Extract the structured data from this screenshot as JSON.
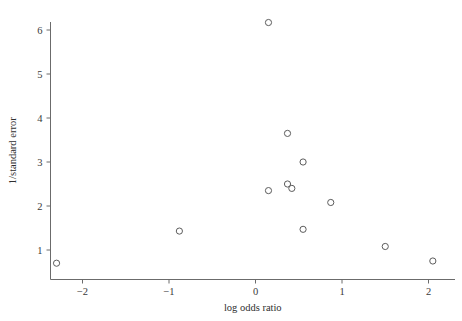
{
  "chart_data": {
    "type": "scatter",
    "title": "",
    "xlabel": "log odds ratio",
    "ylabel": "1/standard error",
    "xlim": [
      -2.55,
      2.3
    ],
    "ylim": [
      0.45,
      6.45
    ],
    "xticks": [
      "−2",
      "−1",
      "0",
      "1",
      "2"
    ],
    "xtick_values": [
      -2,
      -1,
      0,
      1,
      2
    ],
    "yticks": [
      "1",
      "2",
      "3",
      "4",
      "5",
      "6"
    ],
    "ytick_values": [
      1,
      2,
      3,
      4,
      5,
      6
    ],
    "grid": false,
    "legend": "none",
    "marker": "open-circle",
    "marker_color": "#5c5c5c",
    "n_points": 12,
    "points": [
      {
        "x": -2.3,
        "y": 0.7
      },
      {
        "x": -0.88,
        "y": 1.43
      },
      {
        "x": 0.15,
        "y": 6.17
      },
      {
        "x": 0.15,
        "y": 2.35
      },
      {
        "x": 0.37,
        "y": 3.65
      },
      {
        "x": 0.37,
        "y": 2.5
      },
      {
        "x": 0.42,
        "y": 2.4
      },
      {
        "x": 0.55,
        "y": 3.0
      },
      {
        "x": 0.55,
        "y": 1.47
      },
      {
        "x": 0.87,
        "y": 2.08
      },
      {
        "x": 1.5,
        "y": 1.08
      },
      {
        "x": 2.05,
        "y": 0.75
      }
    ],
    "x_series": [
      -2.3,
      -0.88,
      0.15,
      0.15,
      0.37,
      0.37,
      0.42,
      0.55,
      0.55,
      0.87,
      1.5,
      2.05
    ],
    "y_series": [
      0.7,
      1.43,
      6.17,
      2.35,
      3.65,
      2.5,
      2.4,
      3.0,
      1.47,
      2.08,
      1.08,
      0.75
    ]
  },
  "axes": {
    "x_title": "log odds ratio",
    "y_title": "1/standard error"
  }
}
